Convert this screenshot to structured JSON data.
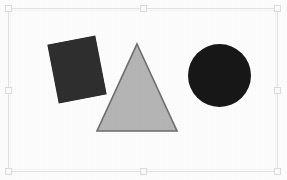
{
  "app": {
    "title": "Shapes Canvas",
    "background_color": "#fdfdfd"
  },
  "selection": {
    "frame_name": "selection-frame",
    "border_color": "#e2e2e2",
    "handle_fill": "#fbfbfb",
    "handle_border": "#dcdcdc",
    "handles": [
      {
        "id": "nw",
        "label": "top-left handle"
      },
      {
        "id": "n",
        "label": "top-center handle"
      },
      {
        "id": "ne",
        "label": "top-right handle"
      },
      {
        "id": "w",
        "label": "middle-left handle"
      },
      {
        "id": "e",
        "label": "middle-right handle"
      },
      {
        "id": "sw",
        "label": "bottom-left handle"
      },
      {
        "id": "s",
        "label": "bottom-center handle"
      },
      {
        "id": "se",
        "label": "bottom-right handle"
      }
    ]
  },
  "canvas": {
    "shapes": [
      {
        "id": "square",
        "label": "Square",
        "kind": "square",
        "fill": "#2f2f2f",
        "stroke": "#2a2a2a",
        "rotation_deg": -11
      },
      {
        "id": "triangle",
        "label": "Triangle",
        "kind": "triangle",
        "fill": "#b5b5b5",
        "stroke": "#6e6e6e",
        "rotation_deg": 0
      },
      {
        "id": "circle",
        "label": "Circle",
        "kind": "circle",
        "fill": "#181818",
        "stroke": "#141414",
        "rotation_deg": 0
      }
    ]
  }
}
